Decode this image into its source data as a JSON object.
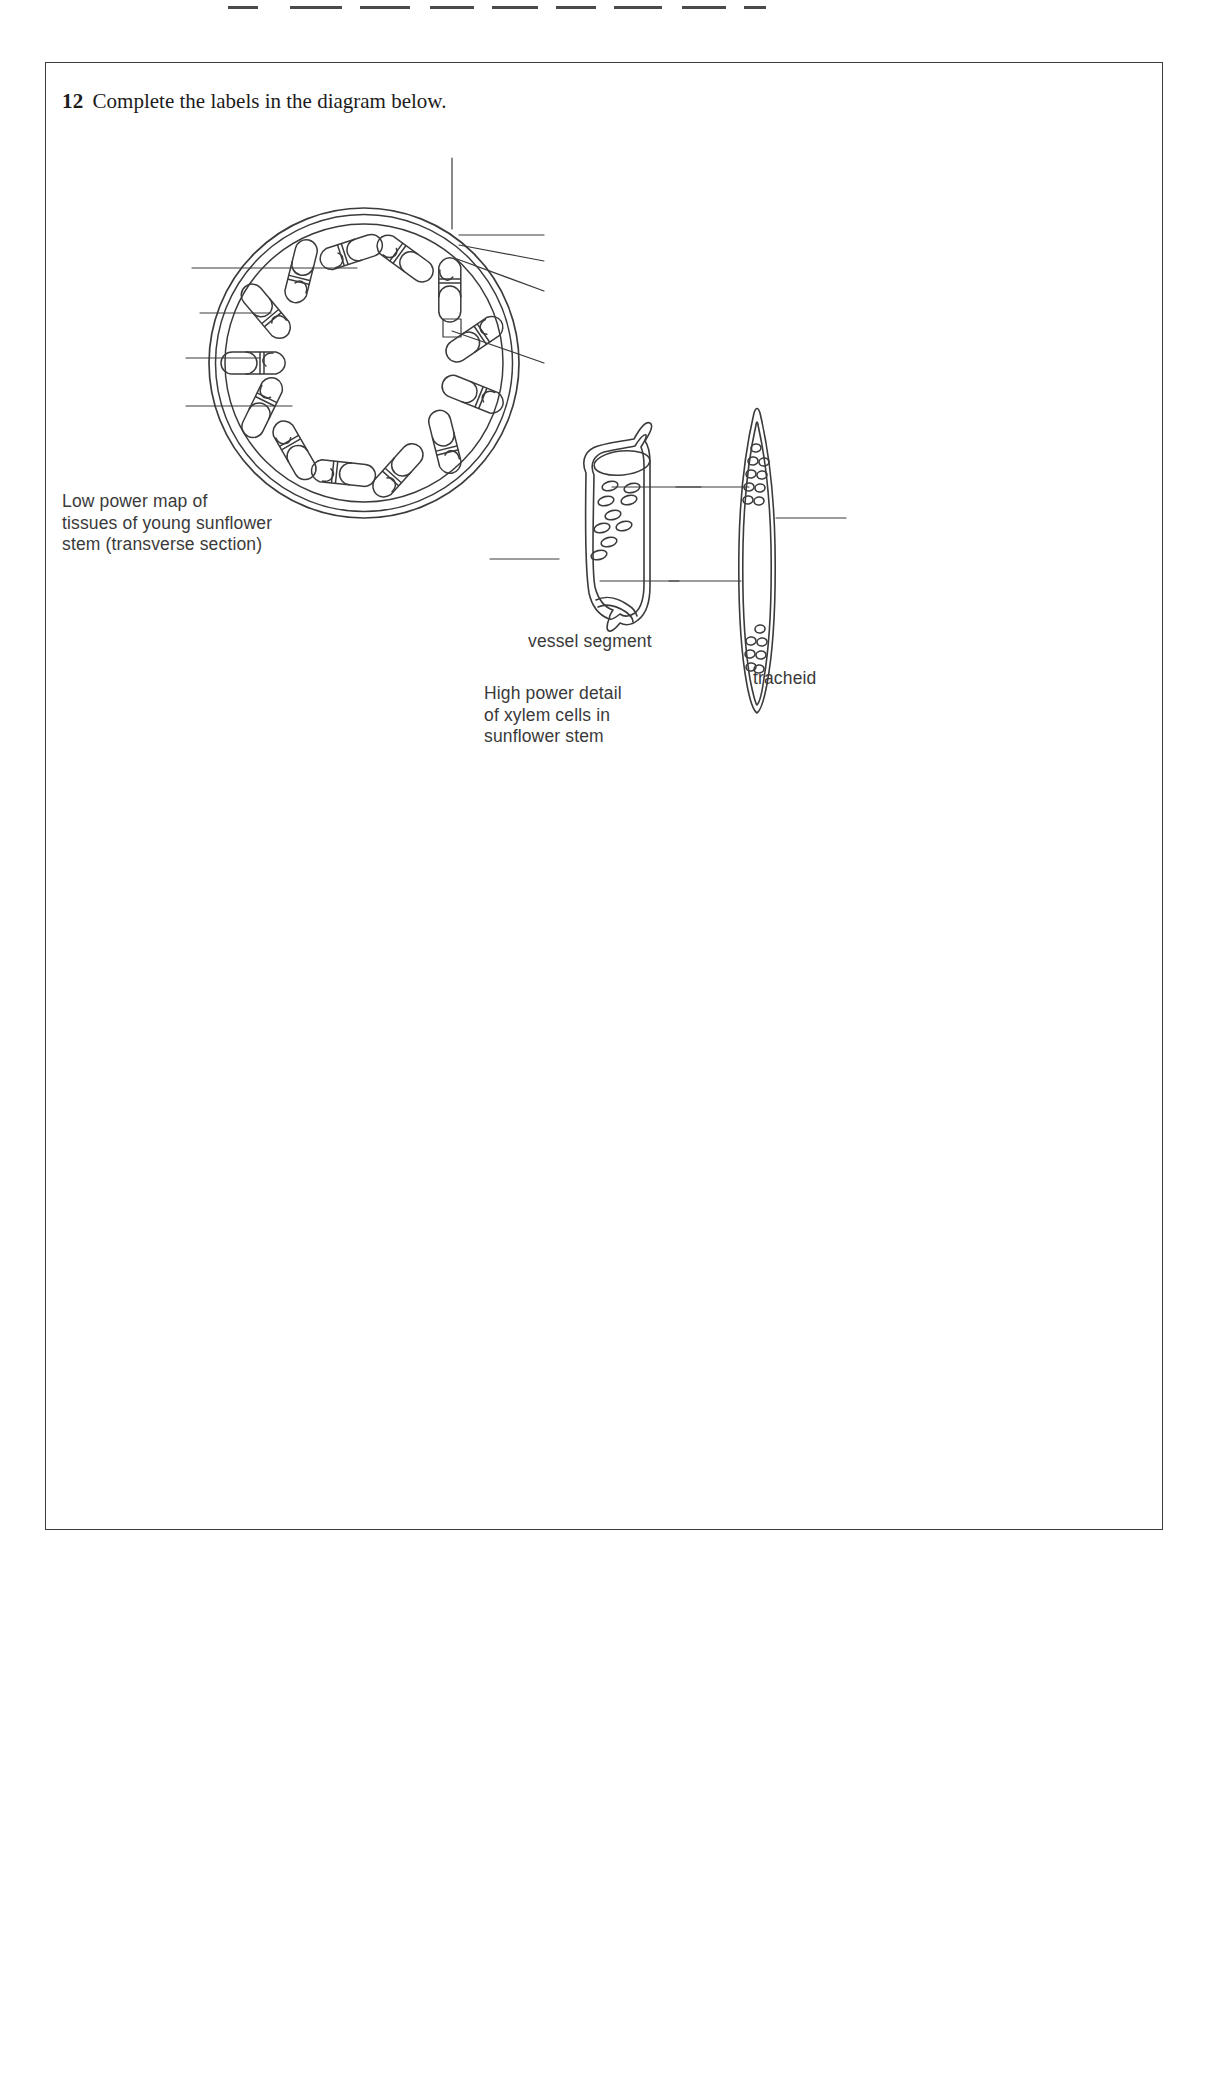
{
  "page": {
    "background_color": "#ffffff",
    "ink_color": "#3b3b3b",
    "text_color": "#1c1c1c",
    "caption_color": "#3a3a3a"
  },
  "question": {
    "number": "12",
    "text": "Complete the labels in the diagram below."
  },
  "diagrams": {
    "low_power": {
      "caption": "Low power map of\ntissues of young sunflower\nstem (transverse section)",
      "description": "transverse section of sunflower stem showing ring of vascular bundles",
      "vascular_bundle_count": 13,
      "blank_label_lines": 8
    },
    "high_power": {
      "caption": "High power detail\nof xylem cells in\nsunflower stem",
      "cells": [
        {
          "name": "vessel segment",
          "label": "vessel segment",
          "blank_label_lines": 3
        },
        {
          "name": "tracheid",
          "label": "tracheid",
          "blank_label_lines": 3
        }
      ]
    }
  },
  "scan_marks": [
    {
      "x": 228,
      "width": 30
    },
    {
      "x": 290,
      "width": 52
    },
    {
      "x": 360,
      "width": 50
    },
    {
      "x": 430,
      "width": 44
    },
    {
      "x": 492,
      "width": 46
    },
    {
      "x": 556,
      "width": 40
    },
    {
      "x": 614,
      "width": 48
    },
    {
      "x": 682,
      "width": 44
    },
    {
      "x": 744,
      "width": 22
    }
  ]
}
